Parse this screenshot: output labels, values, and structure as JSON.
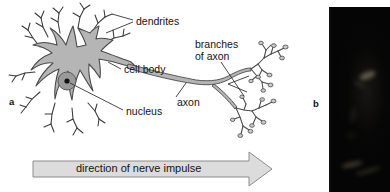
{
  "figure": {
    "panel_a_letter": "a",
    "panel_b_letter": "b",
    "labels": {
      "dendrites": "dendrites",
      "cell_body": "cell body",
      "nucleus": "nucleus",
      "axon": "axon",
      "branches_of_axon_line1": "branches",
      "branches_of_axon_line2": "of axon"
    },
    "arrow": {
      "caption": "direction of nerve impulse"
    },
    "colors": {
      "page_background": "#ffffff",
      "ink": "#141414",
      "cell_fill": "#b5b5b5",
      "cell_outline": "#4a4a4a",
      "nucleus_ring": "#8a8a8a",
      "nucleus_dot": "#111111",
      "arrow_fill": "#dcdcdc",
      "arrow_outline": "#8c8c8c",
      "micrograph_background": "#050505"
    }
  }
}
